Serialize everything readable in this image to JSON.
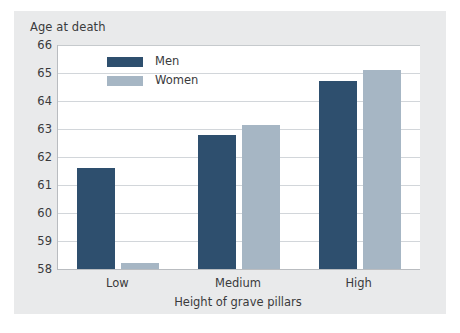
{
  "chart_data": {
    "type": "bar",
    "title": "",
    "subtitle": "",
    "ylabel": "Age at death",
    "xlabel": "Height of grave pillars",
    "categories": [
      "Low",
      "Medium",
      "High"
    ],
    "series": [
      {
        "name": "Men",
        "color": "#2e4f6e",
        "values": [
          61.6,
          62.8,
          64.7
        ]
      },
      {
        "name": "Women",
        "color": "#a6b6c4",
        "values": [
          58.2,
          63.15,
          65.1
        ]
      }
    ],
    "ylim": [
      58,
      66
    ],
    "yticks": [
      58,
      59,
      60,
      61,
      62,
      63,
      64,
      65,
      66
    ],
    "ytick_labels": [
      "58",
      "59",
      "60",
      "61",
      "62",
      "63",
      "64",
      "65",
      "66"
    ],
    "grid": true,
    "grid_axis": "y",
    "legend_position": "top-left-inside",
    "annotations": []
  },
  "legend": {
    "entries": [
      {
        "label": "Men"
      },
      {
        "label": "Women"
      }
    ]
  },
  "colors": {
    "men": "#2e4f6e",
    "women": "#a6b6c4",
    "panel_background": "#e9eaeb",
    "plot_background": "#ffffff",
    "gridline": "#d2d6da",
    "axis_line": "#b9bcc0",
    "text": "#3a3a3c"
  }
}
